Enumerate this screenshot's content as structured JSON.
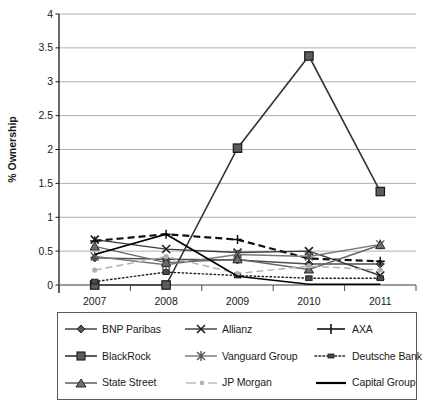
{
  "chart_data": {
    "type": "line",
    "title": "",
    "xlabel": "",
    "ylabel": "% Ownership",
    "categories": [
      "2007",
      "2008",
      "2009",
      "2010",
      "2011"
    ],
    "ylim": [
      0,
      4
    ],
    "yticks": [
      "0",
      "0.5",
      "1",
      "1.5",
      "2",
      "2.5",
      "3",
      "3.5",
      "4"
    ],
    "grid": true,
    "legend_position": "bottom",
    "series": [
      {
        "name": "BNP Paribas",
        "marker": "diamond",
        "line": "solid",
        "color": "#4d4d4d",
        "values": [
          0.4,
          0.38,
          0.37,
          0.31,
          0.31
        ]
      },
      {
        "name": "Allianz",
        "marker": "x",
        "line": "solid",
        "color": "#3a3a3a",
        "values": [
          0.67,
          0.53,
          0.48,
          0.5,
          0.14
        ]
      },
      {
        "name": "AXA",
        "marker": "plus",
        "line": "dashed",
        "color": "#111111",
        "values": [
          0.65,
          0.75,
          0.67,
          0.39,
          0.35
        ]
      },
      {
        "name": "BlackRock",
        "marker": "square",
        "line": "solid",
        "color": "#333333",
        "values": [
          0.0,
          0.0,
          2.02,
          3.38,
          1.38
        ]
      },
      {
        "name": "Vanguard Group",
        "marker": "asterisk",
        "line": "solid",
        "color": "#777777",
        "values": [
          0.42,
          0.3,
          0.45,
          0.42,
          0.6
        ]
      },
      {
        "name": "Deutsche Bank",
        "marker": "minisq",
        "line": "dotted",
        "color": "#222222",
        "values": [
          0.05,
          0.19,
          0.14,
          0.1,
          0.1
        ]
      },
      {
        "name": "State Street",
        "marker": "triangle",
        "line": "solid",
        "color": "#666666",
        "values": [
          0.57,
          0.33,
          0.38,
          0.23,
          0.59
        ]
      },
      {
        "name": "JP Morgan",
        "marker": "dot",
        "line": "dashed",
        "color": "#b0b0b0",
        "values": [
          0.22,
          0.42,
          0.17,
          0.28,
          0.22
        ]
      },
      {
        "name": "Capital Group",
        "marker": "none",
        "line": "solid",
        "color": "#000000",
        "values": [
          0.45,
          0.75,
          0.13,
          0.01,
          0.01
        ]
      }
    ]
  },
  "legend": {
    "items": [
      "BNP Paribas",
      "Allianz",
      "AXA",
      "BlackRock",
      "Vanguard Group",
      "Deutsche Bank",
      "State Street",
      "JP Morgan",
      "Capital Group"
    ]
  }
}
